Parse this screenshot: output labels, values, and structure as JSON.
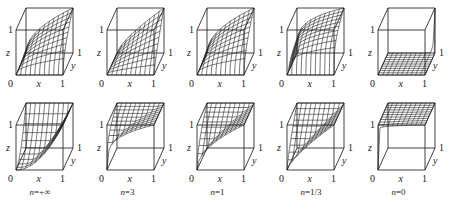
{
  "figure": {
    "axis_labels": {
      "x": "x",
      "y": "y",
      "z": "z",
      "origin": "0",
      "one": "1"
    },
    "columns": [
      {
        "n": "+∞",
        "caption": "n=+∞",
        "exp": 1000
      },
      {
        "n": "3",
        "caption": "n=3",
        "exp": 3
      },
      {
        "n": "1",
        "caption": "n=1",
        "exp": 1
      },
      {
        "n": "1/3",
        "caption": "n=1/3",
        "exp": 0.3333
      },
      {
        "n": "0",
        "caption": "n=0",
        "exp": 0.0001
      }
    ],
    "rows": [
      {
        "name": "top-row",
        "front_top_y": 30,
        "front_bottom_y": 75
      },
      {
        "name": "bottom-row",
        "front_top_y": 125,
        "front_bottom_y": 170
      }
    ],
    "column_front_left_x": [
      16,
      107,
      197,
      287,
      378
    ],
    "cube": {
      "width": 47,
      "depth_dx": 10,
      "depth_dy": -22
    },
    "colors": {
      "line": "#111111",
      "mesh": "#222222",
      "background": "#ffffff"
    }
  }
}
